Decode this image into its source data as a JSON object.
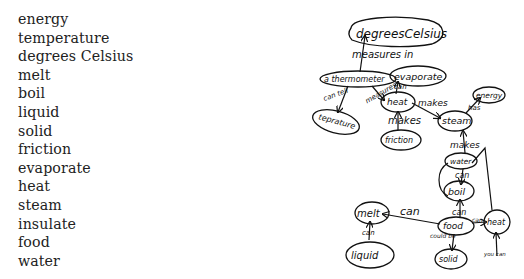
{
  "word_list": [
    "energy",
    "temperature",
    "degrees Celsius",
    "melt",
    "boil",
    "liquid",
    "solid",
    "friction",
    "evaporate",
    "heat",
    "steam",
    "insulate",
    "food",
    "water"
  ],
  "concept_map": {
    "nodes": {
      "degrees_celsius": "degreesCelsius",
      "thermometer": "a thermometer",
      "evaporate": "evaporate",
      "temperature": "teprature",
      "heat": "heat",
      "friction": "friction",
      "steam": "steam",
      "energy": "energy",
      "water": "water",
      "boil": "boil",
      "melt": "melt",
      "food": "food",
      "heat2": "heat",
      "liquid": "liquid",
      "solid": "solid"
    },
    "links": {
      "measures_in": "measures in",
      "can_tell": "can tell",
      "measures": "measures",
      "can_evaporate": "can",
      "makes_heat": "makes",
      "heat_makes_steam": "makes",
      "has": "has",
      "water_makes_steam": "makes",
      "water_can_boil": "can",
      "food_can_boil": "can",
      "food_can_melt": "can",
      "food_can_heat": "can",
      "could_be": "could be",
      "liquid_can": "can",
      "you_can": "you can",
      "can_see": "can see"
    }
  }
}
